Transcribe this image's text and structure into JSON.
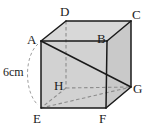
{
  "figure": {
    "type": "cube-diagram",
    "shape_name": "cube",
    "background_color": "#ffffff",
    "face_fill_color": "#d4d4d4",
    "edge_color": "#1a1a1a",
    "hidden_edge_color": "#8a8a8a"
  },
  "vertices": {
    "A": {
      "label": "A",
      "x": 41,
      "y": 41,
      "label_x": 27,
      "label_y": 33,
      "hidden": false
    },
    "B": {
      "label": "B",
      "x": 107,
      "y": 41,
      "label_x": 97,
      "label_y": 32,
      "hidden": false
    },
    "C": {
      "label": "C",
      "x": 131,
      "y": 21,
      "label_x": 132,
      "label_y": 10,
      "hidden": false
    },
    "D": {
      "label": "D",
      "x": 66,
      "y": 21,
      "label_x": 60,
      "label_y": 7,
      "hidden": false
    },
    "E": {
      "label": "E",
      "x": 41,
      "y": 108,
      "label_x": 34,
      "label_y": 112,
      "hidden": false
    },
    "F": {
      "label": "F",
      "x": 106,
      "y": 108,
      "label_x": 100,
      "label_y": 112,
      "hidden": false
    },
    "G": {
      "label": "G",
      "x": 131,
      "y": 87,
      "label_x": 133,
      "label_y": 84,
      "hidden": false
    },
    "H": {
      "label": "H",
      "x": 66,
      "y": 88,
      "label_x": 54,
      "label_y": 79,
      "hidden": true
    }
  },
  "dimension": {
    "label": "6cm",
    "label_x": 4,
    "label_y": 66,
    "measures_edge": "A-E"
  },
  "diagonals": [
    {
      "from": "A",
      "to": "G",
      "style": "solid"
    },
    {
      "from": "E",
      "to": "G",
      "style": "dashed"
    }
  ],
  "edges": [
    {
      "from": "A",
      "to": "B",
      "style": "solid"
    },
    {
      "from": "B",
      "to": "C",
      "style": "solid"
    },
    {
      "from": "C",
      "to": "D",
      "style": "solid"
    },
    {
      "from": "D",
      "to": "A",
      "style": "solid"
    },
    {
      "from": "A",
      "to": "E",
      "style": "solid"
    },
    {
      "from": "B",
      "to": "F",
      "style": "solid"
    },
    {
      "from": "C",
      "to": "G",
      "style": "solid"
    },
    {
      "from": "E",
      "to": "F",
      "style": "solid"
    },
    {
      "from": "F",
      "to": "G",
      "style": "solid"
    },
    {
      "from": "D",
      "to": "H",
      "style": "dashed"
    },
    {
      "from": "H",
      "to": "E",
      "style": "dashed"
    },
    {
      "from": "H",
      "to": "G",
      "style": "dashed"
    }
  ]
}
